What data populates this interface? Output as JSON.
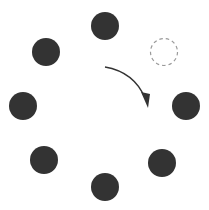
{
  "diagram": {
    "width": 209,
    "height": 210,
    "background": "#ffffff",
    "dot_color": "#333333",
    "dashed_color": "#9a9a9a",
    "arrow_color": "#333333",
    "dot_radius": 14,
    "dots": [
      {
        "name": "dot-top",
        "cx": 105,
        "cy": 26
      },
      {
        "name": "dot-top-left",
        "cx": 46,
        "cy": 52
      },
      {
        "name": "dot-left",
        "cx": 23,
        "cy": 106
      },
      {
        "name": "dot-bottom-left",
        "cx": 44,
        "cy": 160
      },
      {
        "name": "dot-bottom",
        "cx": 105,
        "cy": 187
      },
      {
        "name": "dot-bottom-right",
        "cx": 162,
        "cy": 163
      },
      {
        "name": "dot-right",
        "cx": 186,
        "cy": 106
      }
    ],
    "missing_dot": {
      "name": "missing-dot-placeholder",
      "cx": 164,
      "cy": 52,
      "r": 13.5
    },
    "arrow": {
      "path": "M105,67 Q134,72 145,98",
      "head": "141,92 148,108 150,94"
    }
  }
}
